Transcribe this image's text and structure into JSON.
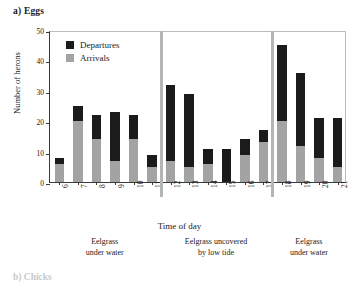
{
  "panel": {
    "title": "a) Eggs",
    "next_panel_title": "b) Chicks"
  },
  "legend": {
    "items": [
      {
        "label": "Departures",
        "color": "#1b1b1b",
        "key": "departures"
      },
      {
        "label": "Arrivals",
        "color": "#a3a3a3",
        "key": "arrivals"
      }
    ]
  },
  "zones": [
    {
      "label_line1": "Eelgrass",
      "label_line2": "under water"
    },
    {
      "label_line1": "Eelgrass uncovered",
      "label_line2": "by low tide"
    },
    {
      "label_line1": "Eelgrass",
      "label_line2": "under water"
    }
  ],
  "chart_data": {
    "type": "bar",
    "subtype": "stacked",
    "title": "a) Eggs",
    "xlabel": "Time of day",
    "ylabel": "Number of herons",
    "ylim": [
      0,
      50
    ],
    "yticks": [
      0,
      10,
      20,
      30,
      40,
      50
    ],
    "grid": false,
    "legend_position": "top-left",
    "categories": [
      "6",
      "7",
      "8",
      "9",
      "10",
      "11",
      "12",
      "13",
      "14",
      "15",
      "16",
      "17",
      "18",
      "19",
      "20",
      "21"
    ],
    "series": [
      {
        "name": "Arrivals",
        "color": "#a3a3a3",
        "values": [
          6,
          20,
          14,
          7,
          14,
          5,
          7,
          5,
          6,
          0,
          9,
          13,
          20,
          12,
          8,
          5
        ]
      },
      {
        "name": "Departures",
        "color": "#1b1b1b",
        "values": [
          2,
          5,
          8,
          16,
          8,
          4,
          25,
          24,
          5,
          11,
          5,
          4,
          25,
          24,
          13,
          16
        ]
      }
    ],
    "totals": [
      8,
      25,
      22,
      23,
      22,
      9,
      32,
      29,
      11,
      11,
      14,
      17,
      45,
      36,
      21,
      21
    ],
    "zone_breaks_after": [
      "11",
      "17"
    ]
  }
}
